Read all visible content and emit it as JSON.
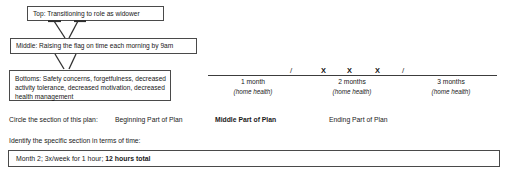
{
  "goal_boxes": {
    "top": "Top: Transitioning to role as widower",
    "middle": "Middle: Raising the flag on time each morning by 9am",
    "bottom_line1": "Bottoms: Safety concerns, forgetfulness, decreased",
    "bottom_line2": "activity tolerance, decreased motivation, decreased",
    "bottom_line3": "health management"
  },
  "timeline": {
    "segments": [
      {
        "label": "1 month",
        "sublabel": "(home health)"
      },
      {
        "label": "2 months",
        "sublabel": "(home health)"
      },
      {
        "label": "3 months",
        "sublabel": "(home health)"
      }
    ],
    "marks": [
      {
        "glyph": "/",
        "type": "slash",
        "x": 84
      },
      {
        "glyph": "X",
        "type": "cross",
        "x": 115
      },
      {
        "glyph": "X",
        "type": "cross",
        "x": 141
      },
      {
        "glyph": "X",
        "type": "cross",
        "x": 169
      },
      {
        "glyph": "/",
        "type": "slash",
        "x": 196
      }
    ]
  },
  "circle_row": {
    "prompt": "Circle the section of this plan:",
    "option_beginning": "Beginning Part of Plan",
    "option_middle": "Middle Part of Plan",
    "option_ending": "Ending Part of Plan"
  },
  "identify": {
    "label": "Identify the specific section in terms of time:",
    "answer_plain": "Month 2; 3x/week for 1 hour;",
    "answer_bold": "12 hours total"
  },
  "colors": {
    "border": "#4a4a4a",
    "text": "#171717",
    "background": "#ffffff"
  }
}
